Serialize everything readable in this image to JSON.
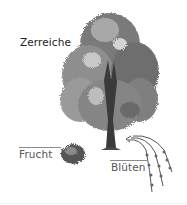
{
  "title": "Zerreiche",
  "labels": {
    "fruit": "Frucht",
    "blossoms": "Blüten"
  },
  "colors": {
    "background": "#ffffff",
    "foliage_dark": "#5a5a5a",
    "foliage_mid": "#8c8c8c",
    "foliage_light": "#c4c4c4",
    "trunk": "#3a3a3a",
    "text": "#333333",
    "rule": "#8a8a8a"
  },
  "illustration": {
    "subject": "tree",
    "parts": [
      "tree-crown",
      "trunk",
      "fruit-cupule",
      "catkins"
    ]
  }
}
